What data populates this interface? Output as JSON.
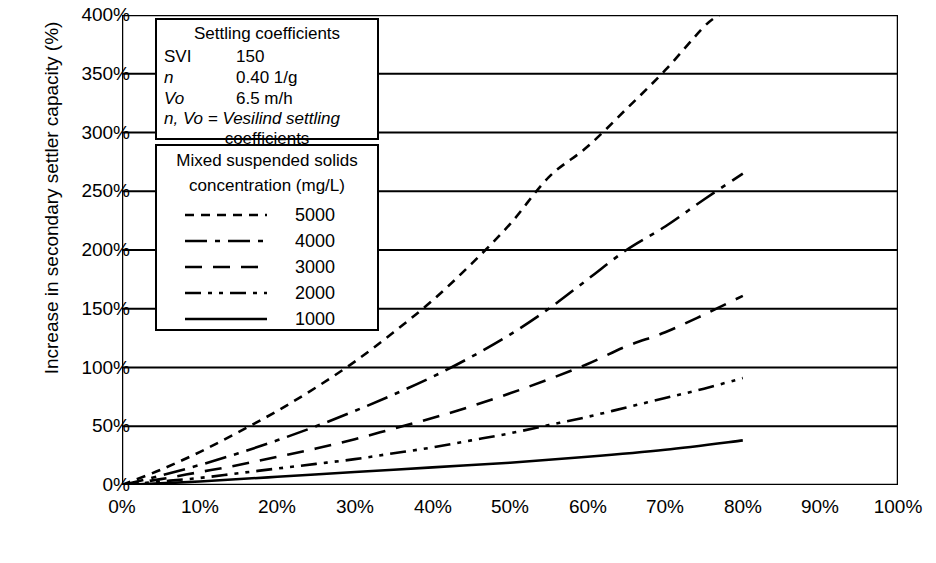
{
  "chart_data": {
    "type": "line",
    "title": "",
    "xlabel": "Decrease in mixed liquor suspended solids concentration to final clarifiers (%)",
    "ylabel": "Increase in secondary settler capacity (%)",
    "xlim": [
      0,
      100
    ],
    "ylim": [
      0,
      400
    ],
    "xticks": [
      "0%",
      "10%",
      "20%",
      "30%",
      "40%",
      "50%",
      "60%",
      "70%",
      "80%",
      "90%",
      "100%"
    ],
    "xtick_values": [
      0,
      10,
      20,
      30,
      40,
      50,
      60,
      70,
      80,
      90,
      100
    ],
    "yticks": [
      "0%",
      "50%",
      "100%",
      "150%",
      "200%",
      "250%",
      "300%",
      "350%",
      "400%"
    ],
    "ytick_values": [
      0,
      50,
      100,
      150,
      200,
      250,
      300,
      350,
      400
    ],
    "grid": "horizontal",
    "legend_position": "upper-left",
    "series": [
      {
        "name": "5000",
        "label": "5000",
        "dash": "dashed",
        "color": "#000000",
        "x": [
          0,
          5,
          10,
          15,
          20,
          25,
          30,
          35,
          40,
          45,
          50,
          55,
          60,
          65,
          70,
          75,
          77
        ],
        "y": [
          0,
          13,
          28,
          45,
          63,
          83,
          105,
          130,
          157,
          188,
          222,
          262,
          288,
          320,
          353,
          390,
          400
        ]
      },
      {
        "name": "4000",
        "label": "4000",
        "dash": "dash-dot",
        "color": "#000000",
        "x": [
          0,
          5,
          10,
          15,
          20,
          25,
          30,
          35,
          40,
          45,
          50,
          55,
          60,
          65,
          70,
          75,
          80
        ],
        "y": [
          0,
          8,
          17,
          27,
          38,
          50,
          63,
          77,
          92,
          109,
          128,
          150,
          175,
          200,
          220,
          243,
          265
        ]
      },
      {
        "name": "3000",
        "label": "3000",
        "dash": "long-dash",
        "color": "#000000",
        "x": [
          0,
          5,
          10,
          15,
          20,
          25,
          30,
          35,
          40,
          45,
          50,
          55,
          60,
          65,
          70,
          75,
          80
        ],
        "y": [
          0,
          5,
          11,
          17,
          24,
          31,
          39,
          48,
          57,
          67,
          78,
          90,
          103,
          118,
          130,
          145,
          161
        ]
      },
      {
        "name": "2000",
        "label": "2000",
        "dash": "dash-dot-dot",
        "color": "#000000",
        "x": [
          0,
          5,
          10,
          15,
          20,
          25,
          30,
          35,
          40,
          45,
          50,
          55,
          60,
          65,
          70,
          75,
          80
        ],
        "y": [
          0,
          3,
          6,
          10,
          14,
          18,
          22,
          27,
          32,
          38,
          44,
          51,
          58,
          66,
          74,
          82,
          91
        ]
      },
      {
        "name": "1000",
        "label": "1000",
        "dash": "solid",
        "color": "#000000",
        "x": [
          0,
          10,
          20,
          30,
          40,
          50,
          60,
          70,
          80
        ],
        "y": [
          0,
          3,
          7,
          11,
          15,
          19,
          24,
          30,
          38
        ]
      }
    ],
    "annotations": {
      "settling_coefficients": {
        "title": "Settling coefficients",
        "rows": [
          {
            "key": "SVI",
            "value": "150"
          },
          {
            "key": "n",
            "value": "0.40 1/g"
          },
          {
            "key": "Vo",
            "value": "6.5 m/h"
          }
        ],
        "note_line1": "n, Vo = Vesilind settling",
        "note_line2": "coefficients"
      },
      "legend": {
        "title_line1": "Mixed suspended solids",
        "title_line2": "concentration (mg/L)"
      }
    }
  }
}
